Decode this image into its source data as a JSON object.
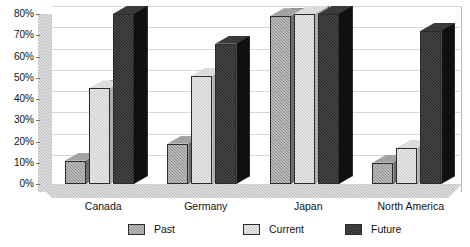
{
  "chart_data": {
    "type": "bar",
    "title": "",
    "subtitle": "",
    "xlabel": "",
    "ylabel": "",
    "categories": [
      "Canada",
      "Germany",
      "Japan",
      "North America"
    ],
    "series": [
      {
        "name": "Past",
        "values": [
          11,
          19,
          79,
          10
        ],
        "color": "#8c8c8c"
      },
      {
        "name": "Current",
        "values": [
          45,
          51,
          80,
          17
        ],
        "color": "#c9c9c9"
      },
      {
        "name": "Future",
        "values": [
          80,
          66,
          80,
          72
        ],
        "color": "#242424"
      }
    ],
    "ylim": [
      0,
      80
    ],
    "ytick_values": [
      0,
      10,
      20,
      30,
      40,
      50,
      60,
      70,
      80
    ],
    "ytick_labels": [
      "0%",
      "10%",
      "20%",
      "30%",
      "40%",
      "50%",
      "60%",
      "70%",
      "80%"
    ],
    "grid": true,
    "legend_position": "bottom",
    "three_d": true,
    "value_unit": "%"
  },
  "legend": {
    "items": [
      {
        "label": "Past"
      },
      {
        "label": "Current"
      },
      {
        "label": "Future"
      }
    ]
  },
  "axis": {
    "y_labels": [
      "80%",
      "70%",
      "60%",
      "50%",
      "40%",
      "30%",
      "20%",
      "10%",
      "0%"
    ],
    "x_labels": [
      "Canada",
      "Germany",
      "Japan",
      "North America"
    ]
  }
}
